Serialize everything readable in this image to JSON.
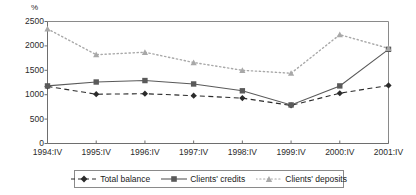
{
  "chart_data": {
    "type": "line",
    "title": "",
    "xlabel": "",
    "ylabel": "%",
    "unit_label": "%",
    "categories": [
      "1994:IV",
      "1995:IV",
      "1996:IV",
      "1997:IV",
      "1998:IV",
      "1999:IV",
      "2000:IV",
      "2001:IV"
    ],
    "ylim": [
      0,
      2500
    ],
    "yticks": [
      0,
      500,
      1000,
      1500,
      2000,
      2500
    ],
    "ytick_labels": [
      "0",
      "500",
      "1000",
      "1500",
      "2000",
      "2500"
    ],
    "grid": false,
    "legend_position": "bottom",
    "series": [
      {
        "name": "Total balance",
        "marker": "diamond",
        "line_style": "dashed",
        "color": "#2b2b2b",
        "values": [
          1170,
          1010,
          1020,
          980,
          930,
          780,
          1030,
          1190
        ]
      },
      {
        "name": "Clients' credits",
        "marker": "square",
        "line_style": "solid",
        "color": "#5a5a5a",
        "values": [
          1180,
          1260,
          1290,
          1220,
          1080,
          790,
          1180,
          1930
        ]
      },
      {
        "name": "Clients' deposits",
        "marker": "triangle",
        "line_style": "dotted",
        "color": "#a8a8a8",
        "values": [
          2350,
          1820,
          1870,
          1660,
          1500,
          1440,
          2230,
          1950
        ]
      }
    ]
  },
  "legend": {
    "items": [
      {
        "label": "Total balance"
      },
      {
        "label": "Clients' credits"
      },
      {
        "label": "Clients' deposits"
      }
    ]
  },
  "colors": {
    "axis": "#6e6e6e",
    "frame": "#8a8a8a",
    "series_total_balance": "#2b2b2b",
    "series_clients_credits": "#5a5a5a",
    "series_clients_deposits": "#a8a8a8",
    "background": "#ffffff"
  }
}
